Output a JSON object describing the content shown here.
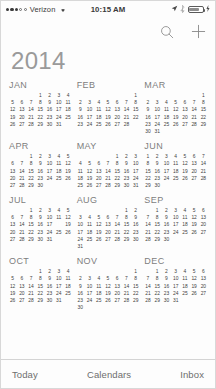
{
  "status_bar": {
    "signal_dots_filled": 3,
    "signal_dots_hollow": 2,
    "carrier": "Verizon",
    "wifi_icon": "wifi-icon",
    "time": "10:15 AM",
    "location_icon": "location-arrow-icon",
    "bluetooth_icon": "bluetooth-icon",
    "battery_icon": "battery-icon",
    "charging_icon": "charging-bolt-icon"
  },
  "nav_bar": {
    "search_icon": "search-icon",
    "add_icon": "plus-icon"
  },
  "header": {
    "year": "2014"
  },
  "calendar": {
    "today": {
      "month": "JUL",
      "day": 18
    },
    "months": [
      {
        "name": "JAN",
        "start_weekday": 3,
        "days": 31
      },
      {
        "name": "FEB",
        "start_weekday": 6,
        "days": 28
      },
      {
        "name": "MAR",
        "start_weekday": 6,
        "days": 31
      },
      {
        "name": "APR",
        "start_weekday": 2,
        "days": 30
      },
      {
        "name": "MAY",
        "start_weekday": 4,
        "days": 31
      },
      {
        "name": "JUN",
        "start_weekday": 0,
        "days": 30
      },
      {
        "name": "JUL",
        "start_weekday": 2,
        "days": 31
      },
      {
        "name": "AUG",
        "start_weekday": 5,
        "days": 31
      },
      {
        "name": "SEP",
        "start_weekday": 1,
        "days": 30
      },
      {
        "name": "OCT",
        "start_weekday": 3,
        "days": 31
      },
      {
        "name": "NOV",
        "start_weekday": 6,
        "days": 30
      },
      {
        "name": "DEC",
        "start_weekday": 1,
        "days": 31
      }
    ]
  },
  "toolbar": {
    "today_label": "Today",
    "calendars_label": "Calendars",
    "inbox_label": "Inbox"
  },
  "colors": {
    "year_text": "#9a9a9a",
    "month_name": "#7d7d7d",
    "day_text": "#3e3e3e",
    "today_bg": "#4f4f4f",
    "toolbar_text": "#6e6e6e",
    "nav_icon": "#8a8a8a"
  }
}
